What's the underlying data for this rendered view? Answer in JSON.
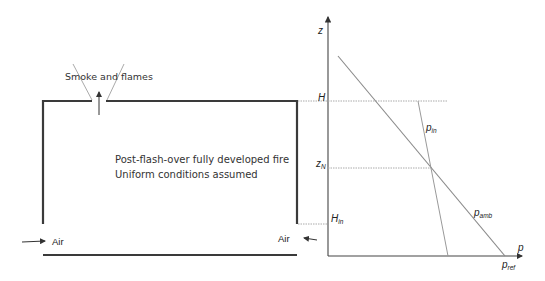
{
  "compartment": {
    "top_label": "Smoke and flames",
    "description_line1": "Post-flash-over fully developed fire",
    "description_line2": "Uniform conditions assumed",
    "air_left": "Air",
    "air_right": "Air"
  },
  "pressure_plot": {
    "y_axis_label": "z",
    "x_axis_label": "p",
    "h_label": "H",
    "zn_label": "z",
    "zn_sub": "N",
    "hin_label": "H",
    "hin_sub": "in",
    "pin_label": "p",
    "pin_sub": "in",
    "pamb_label": "p",
    "pamb_sub": "amb",
    "pref_label": "p",
    "pref_sub": "ref"
  },
  "colors": {
    "wall": "#3a3a3a",
    "axis": "#444444",
    "line": "#8a8a8a",
    "dotted": "#aaaaaa"
  }
}
